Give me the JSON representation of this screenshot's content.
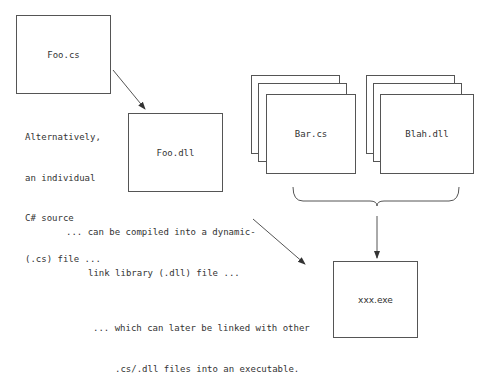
{
  "diagram": {
    "title": "",
    "boxes": {
      "foo_cs": "Foo.cs",
      "foo_dll": "Foo.dll",
      "bar_cs": "Bar.cs",
      "blah_dll": "Blah.dll",
      "xxx_exe": "xxx.exe"
    },
    "notes": {
      "source": {
        "line1": "Alternatively,",
        "line2": "an individual",
        "line3": "C# source",
        "line4": "(.cs) file ..."
      },
      "compiled": {
        "line1": "... can be compiled into a dynamic-",
        "line2": "link library (.dll) file ..."
      },
      "linked": {
        "line1": "... which can later be linked with other",
        "line2": ".cs/.dll files into an executable."
      }
    },
    "colors": {
      "stroke": "#555555",
      "text": "#333333",
      "background": "#ffffff"
    }
  }
}
